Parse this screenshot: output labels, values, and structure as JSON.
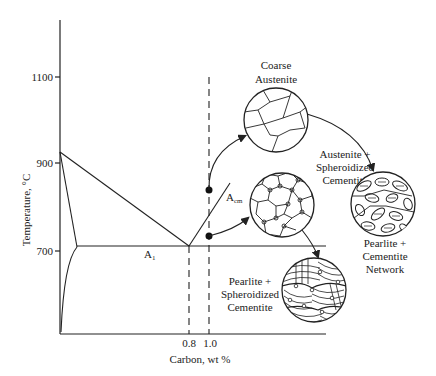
{
  "diagram": {
    "type": "Fe-C phase diagram detail (spheroidizing heat treatment)",
    "y_axis": {
      "label": "Temperature, °C",
      "ticks": [
        "1100",
        "900",
        "700"
      ]
    },
    "x_axis": {
      "label": "Carbon, wt %",
      "ticks": [
        "0.8",
        "1.0"
      ]
    },
    "lines": {
      "a1_label": "A",
      "a1_sub": "1",
      "acm_label": "A",
      "acm_sub": "cm"
    },
    "microstructures": [
      {
        "id": "coarse-austenite",
        "label_lines": [
          "Coarse",
          "Austenite"
        ]
      },
      {
        "id": "austenite-spheroidized",
        "label_lines": [
          "Austenite +",
          "Spheroidized",
          "Cementite"
        ]
      },
      {
        "id": "pearlite-network",
        "label_lines": [
          "Pearlite +",
          "Cementite",
          "Network"
        ]
      },
      {
        "id": "pearlite-spheroidized",
        "label_lines": [
          "Pearlite +",
          "Spheroidized",
          "Cementite"
        ]
      }
    ]
  }
}
